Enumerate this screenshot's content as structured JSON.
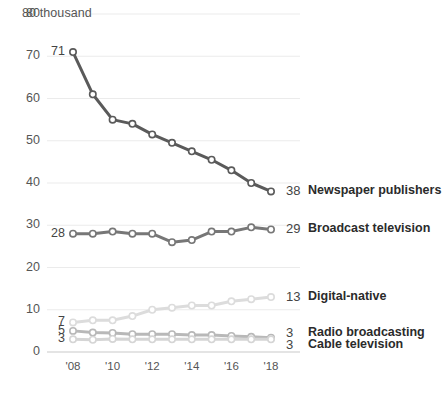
{
  "chart_data": {
    "type": "line",
    "title": "",
    "subtitle": "",
    "unit_label": "80 thousand",
    "xlabel": "",
    "ylabel": "",
    "ylim": [
      0,
      80
    ],
    "xlim": [
      2008,
      2018
    ],
    "grid": true,
    "grid_axis": "y",
    "legend_position": "right-end-of-line",
    "x": [
      2008,
      2009,
      2010,
      2011,
      2012,
      2013,
      2014,
      2015,
      2016,
      2017,
      2018
    ],
    "xtick_labels": [
      "'08",
      "'10",
      "'12",
      "'14",
      "'16",
      "'18"
    ],
    "xtick_values": [
      2008,
      2010,
      2012,
      2014,
      2016,
      2018
    ],
    "ytick_labels": [
      "0",
      "10",
      "20",
      "30",
      "40",
      "50",
      "60",
      "70",
      "80"
    ],
    "ytick_values": [
      0,
      10,
      20,
      30,
      40,
      50,
      60,
      70,
      80
    ],
    "series": [
      {
        "name": "Newspaper publishers",
        "color": "#5a5a5a",
        "start_label": "71",
        "end_label": "38",
        "values": [
          71,
          61,
          55,
          54,
          51.5,
          49.5,
          47.5,
          45.5,
          43,
          40,
          38
        ]
      },
      {
        "name": "Broadcast television",
        "color": "#777777",
        "start_label": "28",
        "end_label": "29",
        "values": [
          28,
          28,
          28.5,
          28,
          28,
          26,
          26.5,
          28.5,
          28.5,
          29.5,
          29
        ]
      },
      {
        "name": "Digital-native",
        "color": "#dcdcdc",
        "start_label": "7",
        "end_label": "13",
        "values": [
          7,
          7.5,
          7.5,
          8.5,
          10,
          10.5,
          11,
          11,
          12,
          12.5,
          13
        ]
      },
      {
        "name": "Radio broadcasting",
        "color": "#b8b8b8",
        "start_label": "5",
        "end_label": "3",
        "values": [
          5,
          4.6,
          4.5,
          4.2,
          4.2,
          4.2,
          4,
          4,
          3.8,
          3.6,
          3.4
        ]
      },
      {
        "name": "Cable television",
        "color": "#d5d5d5",
        "start_label": "3",
        "end_label": "3",
        "values": [
          3,
          2.9,
          3.1,
          3,
          3,
          3,
          3,
          3,
          3,
          3,
          3
        ]
      }
    ]
  },
  "axis": {
    "unit_label": "80 thousand",
    "baseline_color": "#c9c9c9",
    "grid_color": "#ebebeb"
  },
  "end_labels": [
    {
      "value": "38",
      "name": "Newspaper publishers"
    },
    {
      "value": "29",
      "name": "Broadcast television"
    },
    {
      "value": "13",
      "name": "Digital-native"
    },
    {
      "value": "3",
      "name": "Radio broadcasting"
    },
    {
      "value": "3",
      "name": "Cable television"
    }
  ],
  "start_labels": [
    {
      "value": "71"
    },
    {
      "value": "28"
    },
    {
      "value": "7"
    },
    {
      "value": "5"
    },
    {
      "value": "3"
    }
  ]
}
